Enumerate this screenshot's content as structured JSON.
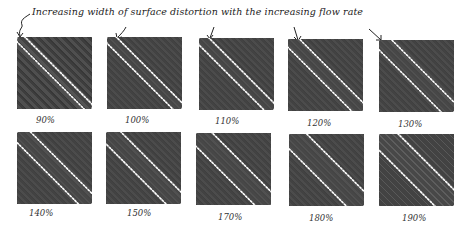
{
  "annotation": {
    "text": "Increasing width of surface distortion with the increasing flow rate"
  },
  "panels": [
    {
      "label": "90%",
      "band_width": 9
    },
    {
      "label": "100%",
      "band_width": 11
    },
    {
      "label": "110%",
      "band_width": 12
    },
    {
      "label": "120%",
      "band_width": 14
    },
    {
      "label": "130%",
      "band_width": 16
    },
    {
      "label": "140%",
      "band_width": 17
    },
    {
      "label": "150%",
      "band_width": 19
    },
    {
      "label": "170%",
      "band_width": 21
    },
    {
      "label": "180%",
      "band_width": 23
    },
    {
      "label": "190%",
      "band_width": 25
    }
  ],
  "colors": {
    "panel_bg": "#464646",
    "dotted_outline": "#ffffff",
    "text": "#222222"
  }
}
